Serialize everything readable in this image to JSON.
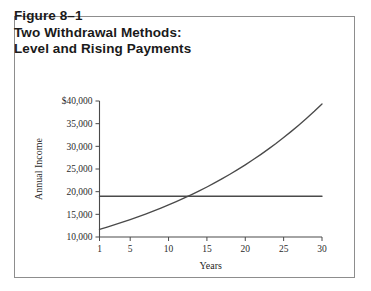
{
  "figure": {
    "title_lines": [
      "Figure 8–1",
      "Two Withdrawal Methods:",
      "Level and Rising Payments"
    ],
    "border_color": "#8d8d8d",
    "background": "#ffffff"
  },
  "chart_data": {
    "type": "line",
    "title": "Two Withdrawal Methods: Level and Rising Payments",
    "xlabel": "Years",
    "ylabel": "Annual Income",
    "xlim": [
      1,
      30
    ],
    "ylim": [
      10000,
      40000
    ],
    "grid": false,
    "legend": "none",
    "line_color": "#4a4a4a",
    "x_ticks": [
      1,
      5,
      10,
      15,
      20,
      25,
      30
    ],
    "x_tick_labels": [
      "1",
      "5",
      "10",
      "15",
      "20",
      "25",
      "30"
    ],
    "y_ticks": [
      10000,
      15000,
      20000,
      25000,
      30000,
      35000,
      40000
    ],
    "y_tick_labels": [
      "10,000",
      "15,000",
      "20,000",
      "25,000",
      "30,000",
      "35,000",
      "$40,000"
    ],
    "x": [
      1,
      2,
      3,
      4,
      5,
      6,
      7,
      8,
      9,
      10,
      11,
      12,
      13,
      14,
      15,
      16,
      17,
      18,
      19,
      20,
      21,
      22,
      23,
      24,
      25,
      26,
      27,
      28,
      29,
      30
    ],
    "series": [
      {
        "name": "Level Payments",
        "style": "flat",
        "values": [
          19000,
          19000,
          19000,
          19000,
          19000,
          19000,
          19000,
          19000,
          19000,
          19000,
          19000,
          19000,
          19000,
          19000,
          19000,
          19000,
          19000,
          19000,
          19000,
          19000,
          19000,
          19000,
          19000,
          19000,
          19000,
          19000,
          19000,
          19000,
          19000,
          19000
        ]
      },
      {
        "name": "Rising Payments",
        "style": "exponential",
        "values": [
          11700,
          12200,
          12720,
          13270,
          13840,
          14430,
          15050,
          15690,
          16360,
          17060,
          17790,
          18550,
          19340,
          20170,
          21030,
          21930,
          22860,
          23840,
          24860,
          25920,
          27030,
          28180,
          29380,
          30630,
          31940,
          33300,
          34720,
          36200,
          37740,
          39350
        ]
      }
    ],
    "annotations": [
      {
        "text": "crossover",
        "x": 13,
        "y": 19000
      }
    ]
  }
}
